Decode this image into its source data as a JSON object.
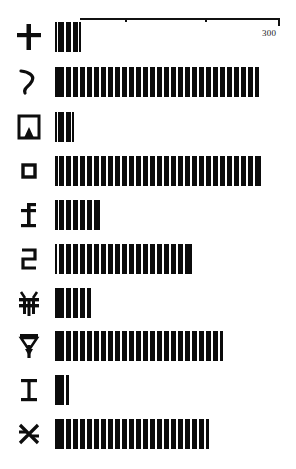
{
  "figure": {
    "title": "",
    "axis": {
      "max_label": "300",
      "origin_px": 80,
      "length_px": 200,
      "ticks": [
        {
          "value": 100,
          "pos_px": 45
        },
        {
          "value": 200,
          "pos_px": 125
        },
        {
          "value": 300,
          "pos_px": 198
        }
      ]
    }
  },
  "chart_data": {
    "type": "bar",
    "orientation": "horizontal",
    "title": "",
    "xlabel": "",
    "ylabel": "",
    "xlim": [
      0,
      300
    ],
    "grid": false,
    "legend": null,
    "axis_tick_labels": [
      "300"
    ],
    "categories": [
      "glyph-cross",
      "glyph-zigzag",
      "glyph-arch-square",
      "glyph-mouth-square",
      "glyph-cross-stem",
      "glyph-hook",
      "glyph-bird",
      "glyph-arrow-down",
      "glyph-i-beam",
      "glyph-x-cross"
    ],
    "categories_labels": [
      "卡",
      "ㄟ",
      "内",
      "口",
      "圡",
      "己",
      "肃",
      "甲",
      "工",
      "癶"
    ],
    "values": [
      38,
      310,
      27,
      313,
      64,
      204,
      52,
      254,
      20,
      230
    ],
    "bar_px_widths": [
      26,
      204,
      19,
      206,
      45,
      137,
      36,
      168,
      14,
      154
    ],
    "bar_color": "#0b0b0b",
    "bar_hatch": "vertical-stripes"
  },
  "rows": [
    {
      "glyph_name": "glyph-cross",
      "glyph": "╋",
      "value": 38,
      "width_px": 26,
      "top_px": 14
    },
    {
      "glyph_name": "glyph-zigzag",
      "glyph": "﹨",
      "value": 310,
      "width_px": 204,
      "top_px": 59
    },
    {
      "glyph_name": "glyph-arch-square",
      "glyph": "冈",
      "value": 27,
      "width_px": 19,
      "top_px": 104
    },
    {
      "glyph_name": "glyph-mouth-square",
      "glyph": "口",
      "value": 313,
      "width_px": 206,
      "top_px": 148
    },
    {
      "glyph_name": "glyph-cross-stem",
      "glyph": "圡",
      "value": 64,
      "width_px": 45,
      "top_px": 192
    },
    {
      "glyph_name": "glyph-hook",
      "glyph": "己",
      "value": 204,
      "width_px": 137,
      "top_px": 236
    },
    {
      "glyph_name": "glyph-bird",
      "glyph": "肃",
      "value": 52,
      "width_px": 36,
      "top_px": 280
    },
    {
      "glyph_name": "glyph-arrow-down",
      "glyph": "甲",
      "value": 254,
      "width_px": 168,
      "top_px": 323
    },
    {
      "glyph_name": "glyph-i-beam",
      "glyph": "工",
      "value": 20,
      "width_px": 14,
      "top_px": 367
    },
    {
      "glyph_name": "glyph-x-cross",
      "glyph": "癶",
      "value": 230,
      "width_px": 154,
      "top_px": 411
    }
  ]
}
